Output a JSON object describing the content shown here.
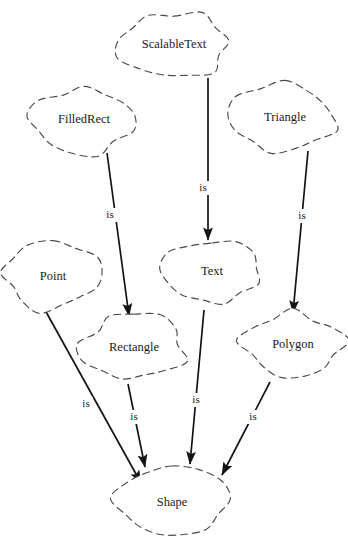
{
  "diagram": {
    "type": "class-inheritance-graph",
    "relation_label": "is",
    "background_color": "#ffffff",
    "node_outline_color": "#4a4a4a",
    "edge_color": "#141414",
    "text_color": "#1a1a1a",
    "nodes": [
      {
        "id": "scalabletext",
        "label": "ScalableText",
        "cx": 174,
        "cy": 45,
        "rx": 54,
        "ry": 33,
        "seed": 3
      },
      {
        "id": "filledrect",
        "label": "FilledRect",
        "cx": 84,
        "cy": 120,
        "rx": 54,
        "ry": 34,
        "seed": 7
      },
      {
        "id": "triangle",
        "label": "Triangle",
        "cx": 285,
        "cy": 118,
        "rx": 53,
        "ry": 34,
        "seed": 11
      },
      {
        "id": "point",
        "label": "Point",
        "cx": 53,
        "cy": 277,
        "rx": 50,
        "ry": 33,
        "seed": 5
      },
      {
        "id": "text",
        "label": "Text",
        "cx": 212,
        "cy": 272,
        "rx": 49,
        "ry": 33,
        "seed": 9
      },
      {
        "id": "rectangle",
        "label": "Rectangle",
        "cx": 134,
        "cy": 348,
        "rx": 52,
        "ry": 34,
        "seed": 13
      },
      {
        "id": "polygon",
        "label": "Polygon",
        "cx": 293,
        "cy": 345,
        "rx": 51,
        "ry": 33,
        "seed": 17
      },
      {
        "id": "shape",
        "label": "Shape",
        "cx": 172,
        "cy": 503,
        "rx": 55,
        "ry": 37,
        "seed": 19
      }
    ],
    "edges": [
      {
        "id": "e1",
        "from": "filledrect",
        "to": "rectangle",
        "label": "is",
        "x1": 107,
        "y1": 153,
        "x2": 129,
        "y2": 316,
        "lx": 110,
        "ly": 215
      },
      {
        "id": "e2",
        "from": "scalabletext",
        "to": "text",
        "label": "is",
        "x1": 208,
        "y1": 78,
        "x2": 208,
        "y2": 240,
        "lx": 203,
        "ly": 188
      },
      {
        "id": "e3",
        "from": "triangle",
        "to": "polygon",
        "label": "is",
        "x1": 308,
        "y1": 151,
        "x2": 293,
        "y2": 313,
        "lx": 302,
        "ly": 216
      },
      {
        "id": "e4",
        "from": "point",
        "to": "shape",
        "label": "is",
        "x1": 45,
        "y1": 310,
        "x2": 141,
        "y2": 483,
        "lx": 86,
        "ly": 404
      },
      {
        "id": "e5",
        "from": "rectangle",
        "to": "shape",
        "label": "is",
        "x1": 128,
        "y1": 384,
        "x2": 145,
        "y2": 467,
        "lx": 134,
        "ly": 417
      },
      {
        "id": "e6",
        "from": "text",
        "to": "shape",
        "label": "is",
        "x1": 204,
        "y1": 310,
        "x2": 190,
        "y2": 464,
        "lx": 196,
        "ly": 400
      },
      {
        "id": "e7",
        "from": "polygon",
        "to": "shape",
        "label": "is",
        "x1": 270,
        "y1": 382,
        "x2": 222,
        "y2": 475,
        "lx": 253,
        "ly": 417
      }
    ]
  }
}
